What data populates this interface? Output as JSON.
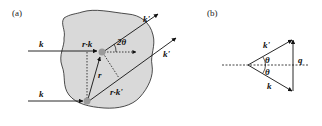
{
  "panels": {
    "a": {
      "label": "(a)",
      "incident_top": "k",
      "incident_bottom": "k",
      "path_incident": "r·k",
      "position_vector": "r",
      "path_scattered": "r·k'",
      "scattered_top": "k'",
      "scattered_bottom": "k'",
      "angle": "2θ"
    },
    "b": {
      "label": "(b)",
      "k_prime": "k'",
      "k": "k",
      "theta_top": "θ",
      "theta_bottom": "θ",
      "q": "q"
    }
  },
  "colors": {
    "blob_fill": "#d9d9d9",
    "stroke": "#111111",
    "scatterer": "#9a9a9a"
  }
}
